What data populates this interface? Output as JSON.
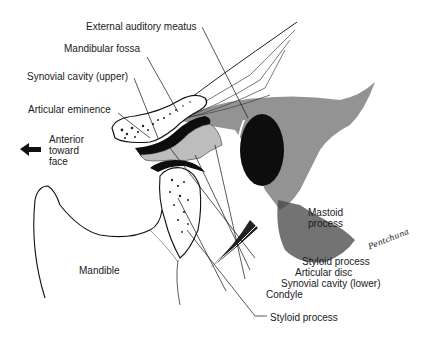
{
  "diagram": {
    "orientation": {
      "arrow": "left-arrow",
      "label": "Anterior\ntoward\nface"
    },
    "labels": {
      "external_auditory_meatus": "External auditory meatus",
      "mandibular_fossa": "Mandibular fossa",
      "synovial_cavity_upper": "Synovial cavity (upper)",
      "articular_eminence": "Articular eminence",
      "mastoid_process": "Mastoid\nprocess",
      "styloid_process_1": "Styloid process",
      "articular_disc": "Articular disc",
      "synovial_cavity_lower": "Synovial cavity (lower)",
      "condyle": "Condyle",
      "styloid_process_2": "Styloid process",
      "mandible": "Mandible"
    },
    "signature": "Pentchuna",
    "colors": {
      "ink": "#111111",
      "background": "#ffffff",
      "disc_fill": "#bdbdbd",
      "bone_fill": "#f2f2f2"
    }
  }
}
